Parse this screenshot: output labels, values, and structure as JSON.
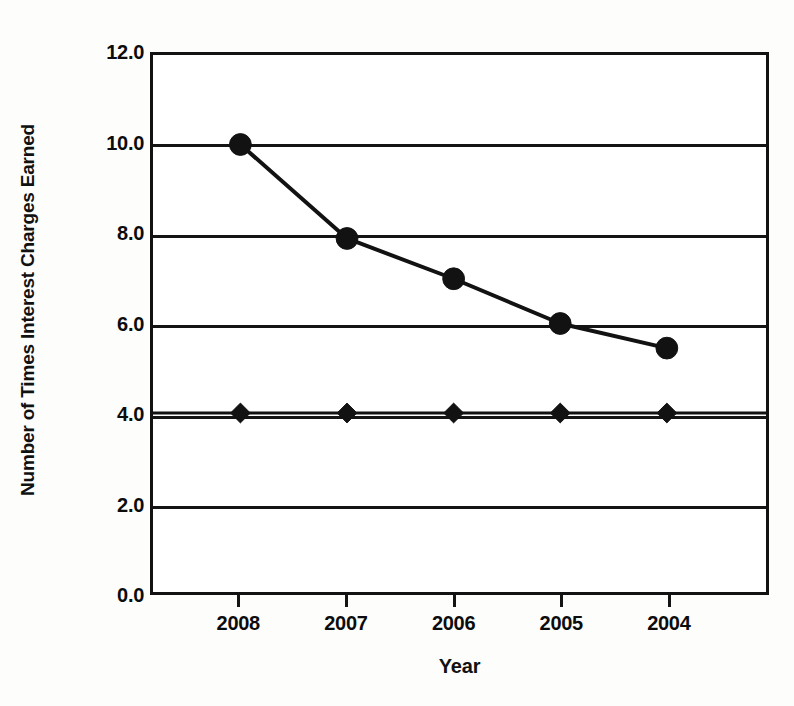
{
  "chart_data": {
    "type": "line",
    "title": "",
    "xlabel": "Year",
    "ylabel": "Number of Times Interest Charges Earned",
    "categories": [
      "2008",
      "2007",
      "2006",
      "2005",
      "2004"
    ],
    "ylim": [
      0.0,
      12.0
    ],
    "ytick_step": 2.0,
    "ytick_labels": [
      "12.0",
      "10.0",
      "8.0",
      "6.0",
      "4.0",
      "2.0",
      "0.0"
    ],
    "ytick_values": [
      12.0,
      10.0,
      8.0,
      6.0,
      4.0,
      2.0,
      0.0
    ],
    "grid": true,
    "grid_axis": "y",
    "legend": "none",
    "series": [
      {
        "name": "Times Interest Charges Earned",
        "marker": "circle",
        "values": [
          10.0,
          7.9,
          7.0,
          6.0,
          5.45
        ]
      },
      {
        "name": "Benchmark",
        "marker": "diamond",
        "values": [
          4.0,
          4.0,
          4.0,
          4.0,
          4.0
        ]
      }
    ],
    "colors": {
      "line": "#121212",
      "marker": "#121212",
      "axis": "#121212",
      "grid": "#141414",
      "background": "#ffffff"
    }
  }
}
